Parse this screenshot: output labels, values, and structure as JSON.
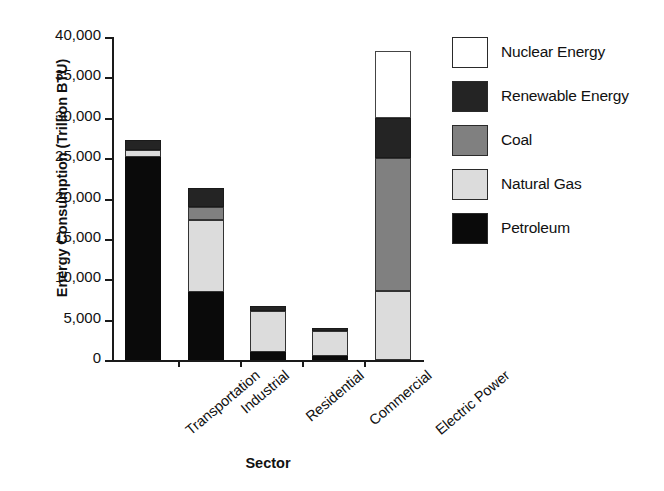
{
  "chart_data": {
    "type": "bar",
    "stacked": true,
    "title": "",
    "xlabel": "Sector",
    "ylabel": "Energy Consumption (Trillion BTU)",
    "categories": [
      "Transportation",
      "Industrial",
      "Residential",
      "Commercial",
      "Electric Power"
    ],
    "ylim": [
      0,
      40000
    ],
    "yticks": [
      0,
      5000,
      10000,
      15000,
      20000,
      25000,
      30000,
      35000,
      40000
    ],
    "ytick_labels": [
      "0",
      "5,000",
      "10,000",
      "15,000",
      "20,000",
      "25,000",
      "30,000",
      "35,000",
      "40,000"
    ],
    "grid": false,
    "legend_position": "right",
    "series": [
      {
        "name": "Petroleum",
        "color": "#0a0a0a",
        "values": [
          25200,
          8400,
          1000,
          500,
          0
        ]
      },
      {
        "name": "Natural Gas",
        "color": "#dcdcdc",
        "values": [
          800,
          9000,
          5100,
          3100,
          8500
        ]
      },
      {
        "name": "Coal",
        "color": "#808080",
        "values": [
          0,
          1600,
          0,
          0,
          16500
        ]
      },
      {
        "name": "Renewable Energy",
        "color": "#242424",
        "values": [
          1200,
          2300,
          600,
          400,
          5000
        ]
      },
      {
        "name": "Nuclear Energy",
        "color": "#ffffff",
        "values": [
          0,
          0,
          0,
          0,
          8300
        ]
      }
    ],
    "totals": [
      27200,
      21300,
      6700,
      4000,
      38300
    ],
    "stack_order_bottom_to_top": [
      "Petroleum",
      "Natural Gas",
      "Coal",
      "Renewable Energy",
      "Nuclear Energy"
    ]
  },
  "legend": {
    "items": [
      {
        "label": "Nuclear Energy",
        "color": "#ffffff"
      },
      {
        "label": "Renewable Energy",
        "color": "#242424"
      },
      {
        "label": "Coal",
        "color": "#808080"
      },
      {
        "label": "Natural Gas",
        "color": "#dcdcdc"
      },
      {
        "label": "Petroleum",
        "color": "#0a0a0a"
      }
    ]
  }
}
